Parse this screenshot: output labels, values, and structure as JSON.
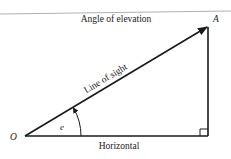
{
  "diagram": {
    "title": "Angle of elevation",
    "points": {
      "origin": "O",
      "target": "A"
    },
    "labels": {
      "hypotenuse": "Line of sight",
      "base": "Horizontal",
      "angle": "e"
    },
    "colors": {
      "stroke": "#1a1a1a",
      "top_rule": "#b0b0b0",
      "background": "#ffffff"
    }
  }
}
